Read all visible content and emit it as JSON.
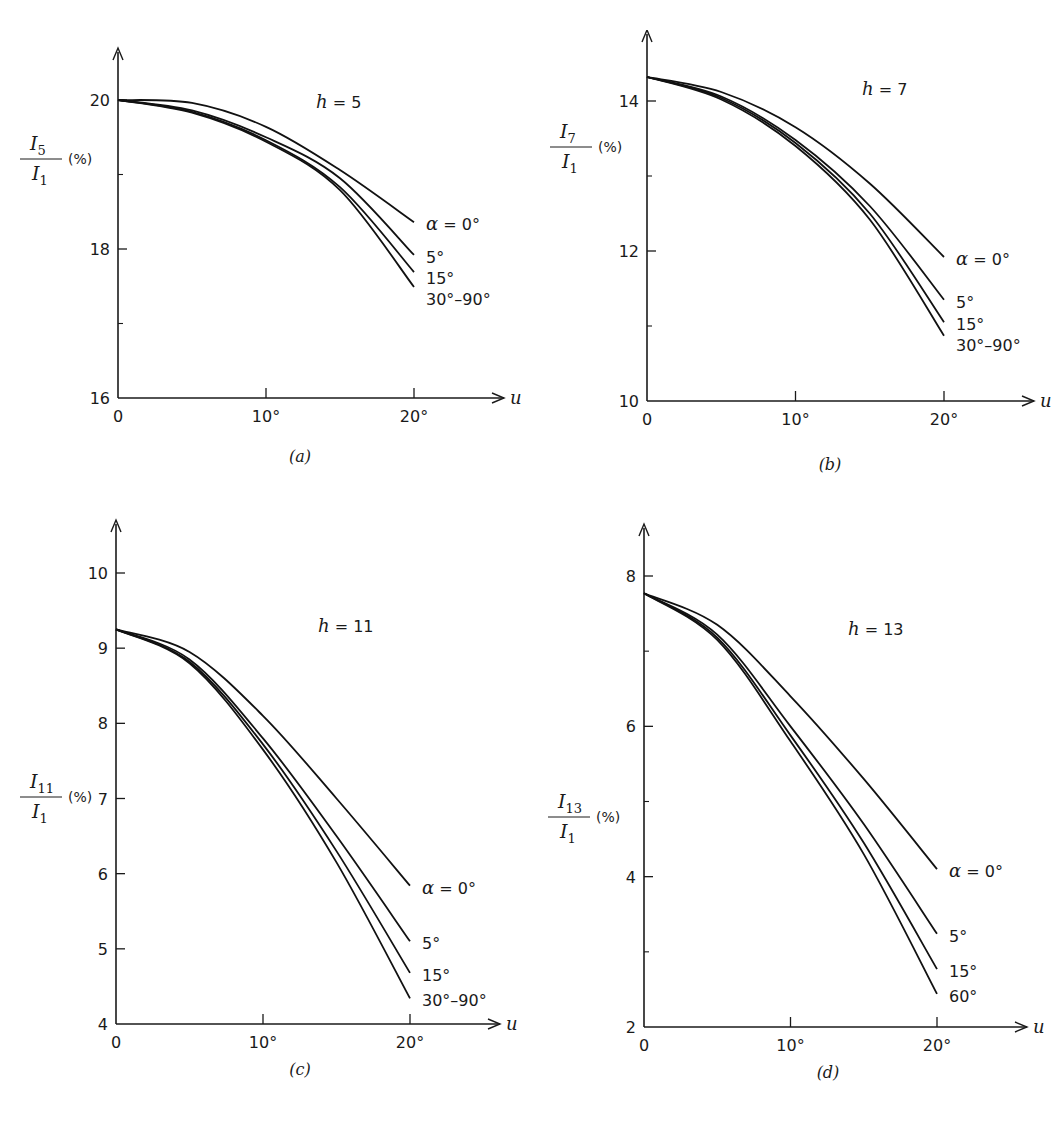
{
  "chart_data": [
    {
      "type": "line",
      "panel_label": "(a)",
      "title": "h = 5",
      "ylabel_num": "I5",
      "ylabel_den": "I1",
      "ylabel_unit": "(%)",
      "xlabel": "u",
      "xlim": [
        0,
        20
      ],
      "ylim": [
        16,
        20
      ],
      "xticks": [
        "0",
        "10°",
        "20°"
      ],
      "yticks": [
        16,
        18,
        20
      ],
      "yminor": [
        17,
        19
      ],
      "grid": false,
      "x": [
        0,
        5,
        10,
        15,
        20
      ],
      "series": [
        {
          "name": "α = 0°",
          "values": [
            20.0,
            19.96,
            19.64,
            19.06,
            18.36
          ]
        },
        {
          "name": "5°",
          "values": [
            20.0,
            19.86,
            19.5,
            18.95,
            17.92
          ]
        },
        {
          "name": "15°",
          "values": [
            20.0,
            19.84,
            19.46,
            18.83,
            17.69
          ]
        },
        {
          "name": "30°–90°",
          "values": [
            20.0,
            19.83,
            19.44,
            18.79,
            17.49
          ]
        }
      ]
    },
    {
      "type": "line",
      "panel_label": "(b)",
      "title": "h = 7",
      "ylabel_num": "I7",
      "ylabel_den": "I1",
      "ylabel_unit": "(%)",
      "xlabel": "u",
      "xlim": [
        0,
        20
      ],
      "ylim": [
        10,
        14
      ],
      "xticks": [
        "0",
        "10°",
        "20°"
      ],
      "yticks": [
        10,
        12,
        14
      ],
      "yminor": [
        11,
        13
      ],
      "grid": false,
      "x": [
        0,
        5,
        10,
        15,
        20
      ],
      "series": [
        {
          "name": "α = 0°",
          "values": [
            14.32,
            14.12,
            13.65,
            12.9,
            11.92
          ]
        },
        {
          "name": "5°",
          "values": [
            14.32,
            14.06,
            13.48,
            12.6,
            11.35
          ]
        },
        {
          "name": "15°",
          "values": [
            14.32,
            14.04,
            13.44,
            12.5,
            11.05
          ]
        },
        {
          "name": "30°–90°",
          "values": [
            14.32,
            14.02,
            13.4,
            12.42,
            10.87
          ]
        }
      ]
    },
    {
      "type": "line",
      "panel_label": "(c)",
      "title": "h = 11",
      "ylabel_num": "I11",
      "ylabel_den": "I1",
      "ylabel_unit": "(%)",
      "xlabel": "u",
      "xlim": [
        0,
        20
      ],
      "ylim": [
        4,
        10
      ],
      "xticks": [
        "0",
        "10°",
        "20°"
      ],
      "yticks": [
        4,
        5,
        6,
        7,
        8,
        9,
        10
      ],
      "yminor": [],
      "grid": false,
      "x": [
        0,
        5,
        10,
        15,
        20
      ],
      "series": [
        {
          "name": "α = 0°",
          "values": [
            9.25,
            8.95,
            8.1,
            7.0,
            5.84
          ]
        },
        {
          "name": "5°",
          "values": [
            9.25,
            8.85,
            7.8,
            6.5,
            5.1
          ]
        },
        {
          "name": "15°",
          "values": [
            9.25,
            8.82,
            7.72,
            6.3,
            4.68
          ]
        },
        {
          "name": "30°–90°",
          "values": [
            9.25,
            8.8,
            7.65,
            6.15,
            4.34
          ]
        }
      ]
    },
    {
      "type": "line",
      "panel_label": "(d)",
      "title": "h = 13",
      "ylabel_num": "I13",
      "ylabel_den": "I1",
      "ylabel_unit": "(%)",
      "xlabel": "u",
      "xlim": [
        0,
        20
      ],
      "ylim": [
        2,
        8
      ],
      "xticks": [
        "0",
        "10°",
        "20°"
      ],
      "yticks": [
        2,
        4,
        6,
        8
      ],
      "yminor": [
        3,
        5,
        7
      ],
      "grid": false,
      "x": [
        0,
        5,
        10,
        15,
        20
      ],
      "series": [
        {
          "name": "α = 0°",
          "values": [
            7.77,
            7.35,
            6.4,
            5.3,
            4.1
          ]
        },
        {
          "name": "5°",
          "values": [
            7.77,
            7.22,
            6.0,
            4.7,
            3.24
          ]
        },
        {
          "name": "15°",
          "values": [
            7.77,
            7.18,
            5.88,
            4.45,
            2.77
          ]
        },
        {
          "name": "60°",
          "values": [
            7.77,
            7.15,
            5.8,
            4.3,
            2.44
          ]
        }
      ]
    }
  ]
}
